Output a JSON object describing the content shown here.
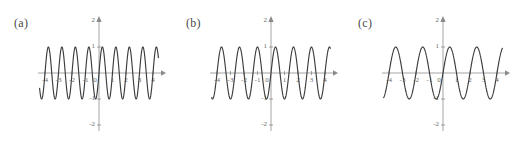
{
  "figure": {
    "background_color": "#ffffff",
    "curve_color": "#3c3c3c",
    "axis_color": "#9a9a9a",
    "label_color": "#4a4a4a"
  },
  "panels": [
    {
      "key": "a",
      "label": "(a)",
      "x_ticks": [
        "-4",
        "-3",
        "-2",
        "-1",
        "0",
        "1",
        "2",
        "3",
        "4"
      ],
      "y_ticks": [
        "2",
        "1",
        "-1",
        "-2"
      ]
    },
    {
      "key": "b",
      "label": "(b)",
      "x_ticks": [
        "-4",
        "-3",
        "-2",
        "-1",
        "0",
        "1",
        "2",
        "3",
        "4"
      ],
      "y_ticks": [
        "2",
        "1",
        "-1",
        "-2"
      ]
    },
    {
      "key": "c",
      "label": "(c)",
      "x_ticks": [
        "-4",
        "-3",
        "-2",
        "-1",
        "0",
        "1",
        "2",
        "3",
        "4"
      ],
      "y_ticks": [
        "2",
        "1",
        "-1",
        "-2"
      ]
    }
  ],
  "chart_data": [
    {
      "type": "line",
      "title": "(a)",
      "xlabel": "",
      "ylabel": "",
      "xlim": [
        -4.4,
        4.4
      ],
      "ylim": [
        -2,
        2
      ],
      "grid": false,
      "legend": "none",
      "xticks": [
        -4,
        -3,
        -2,
        -1,
        0,
        1,
        2,
        3,
        4
      ],
      "yticks": [
        -2,
        -1,
        1,
        2
      ],
      "series": [
        {
          "name": "sin(2*pi*x)",
          "amplitude": 1,
          "period": 1.0,
          "cycles_visible": 8.6,
          "expression": "sin(2*pi*x)"
        }
      ]
    },
    {
      "type": "line",
      "title": "(b)",
      "xlabel": "",
      "ylabel": "",
      "xlim": [
        -4.4,
        4.4
      ],
      "ylim": [
        -2,
        2
      ],
      "grid": false,
      "legend": "none",
      "xticks": [
        -4,
        -3,
        -2,
        -1,
        0,
        1,
        2,
        3,
        4
      ],
      "yticks": [
        -2,
        -1,
        1,
        2
      ],
      "series": [
        {
          "name": "sin(1.5*pi*x)",
          "amplitude": 1,
          "period": 1.333,
          "cycles_visible": 4.6,
          "expression": "sin(1.5*pi*x)"
        }
      ]
    },
    {
      "type": "line",
      "title": "(c)",
      "xlabel": "",
      "ylabel": "",
      "xlim": [
        -4.4,
        4.4
      ],
      "ylim": [
        -2,
        2
      ],
      "grid": false,
      "legend": "none",
      "xticks": [
        -4,
        -3,
        -2,
        -1,
        0,
        1,
        2,
        3,
        4
      ],
      "yticks": [
        -2,
        -1,
        1,
        2
      ],
      "series": [
        {
          "name": "sin(pi*x)",
          "amplitude": 1,
          "period": 2.0,
          "cycles_visible": 2.15,
          "expression": "sin(pi*x)"
        }
      ]
    }
  ]
}
